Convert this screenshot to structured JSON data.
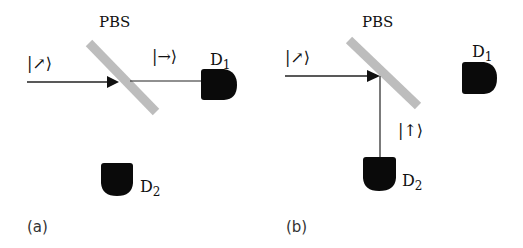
{
  "diagram": {
    "colors": {
      "beam": "#222222",
      "splitter": "#bdbdbd",
      "detector": "#0a0a0a",
      "text": "#111111"
    },
    "panels": [
      {
        "id": "a",
        "caption": "(a)",
        "splitter_label": "PBS",
        "input_state": "|↗⟩",
        "output_state": "|→⟩",
        "output_path": "transmitted",
        "detectors": [
          {
            "name": "D",
            "sub": "1",
            "active": true
          },
          {
            "name": "D",
            "sub": "2",
            "active": false
          }
        ]
      },
      {
        "id": "b",
        "caption": "(b)",
        "splitter_label": "PBS",
        "input_state": "|↗⟩",
        "output_state": "|↑⟩",
        "output_path": "reflected",
        "detectors": [
          {
            "name": "D",
            "sub": "1",
            "active": false
          },
          {
            "name": "D",
            "sub": "2",
            "active": true
          }
        ]
      }
    ]
  }
}
